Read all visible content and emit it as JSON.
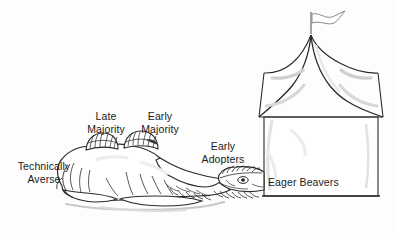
{
  "illustration": {
    "title": "Technology adoption camel and tent illustration",
    "style": "hand-drawn black line art on white background",
    "colors": {
      "background": "#fdfdfd",
      "ink": "#1a1a1a",
      "line": "#2b2b2b",
      "shading": "#c9c9c9",
      "soft_shading": "#dedede",
      "text": "#1a1a1a"
    }
  },
  "labels": {
    "technically_averse": {
      "line1": "Technically",
      "line2": "Averse"
    },
    "late_majority": {
      "line1": "Late",
      "line2": "Majority"
    },
    "early_majority": {
      "line1": "Early",
      "line2": "Majority"
    },
    "early_adopters": {
      "line1": "Early",
      "line2": "Adopters"
    },
    "eager_beavers": {
      "line1": "Eager Beavers"
    }
  },
  "objects": {
    "camel": {
      "name": "reclining two-humped camel",
      "humps": 2
    },
    "tent": {
      "name": "circus style tent with pointed roof"
    },
    "flag": {
      "name": "wavy pennant flag on tent peak"
    }
  }
}
